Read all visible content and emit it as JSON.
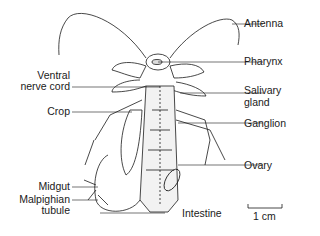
{
  "diagram": {
    "labels_left": [
      {
        "id": "ventral-nerve-cord",
        "lines": [
          "Ventral",
          "nerve cord"
        ]
      },
      {
        "id": "crop",
        "lines": [
          "Crop"
        ]
      },
      {
        "id": "midgut",
        "lines": [
          "Midgut"
        ]
      },
      {
        "id": "malpighian-tubule",
        "lines": [
          "Malpighian",
          "tubule"
        ]
      }
    ],
    "labels_right": [
      {
        "id": "antenna",
        "lines": [
          "Antenna"
        ]
      },
      {
        "id": "pharynx",
        "lines": [
          "Pharynx"
        ]
      },
      {
        "id": "salivary-gland",
        "lines": [
          "Salivary",
          "gland"
        ]
      },
      {
        "id": "ganglion",
        "lines": [
          "Ganglion"
        ]
      },
      {
        "id": "ovary",
        "lines": [
          "Ovary"
        ]
      }
    ],
    "labels_bottom": [
      {
        "id": "intestine",
        "lines": [
          "Intestine"
        ]
      }
    ],
    "scale_bar": {
      "label": "1 cm"
    },
    "colors": {
      "ink": "#1a1a1a",
      "background": "#ffffff"
    }
  }
}
